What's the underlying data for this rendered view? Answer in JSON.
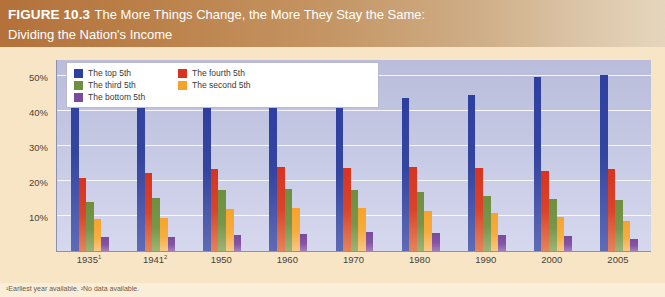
{
  "header": {
    "figure_label": "FIGURE 10.3",
    "title": "The More Things Change, the More They Stay the Same:",
    "subtitle": "Dividing the Nation's Income"
  },
  "footnote": "¹Earliest year available.  ²No data available.",
  "colors": {
    "top_5th": "#2e3fa2",
    "fourth_5th": "#d8331f",
    "third_5th": "#6d8f3f",
    "second_5th": "#f6a32b",
    "bottom_5th": "#7a4a9e",
    "plot_background": "#c3c6e2",
    "page_background": "#f8e5c6",
    "banner_start": "#b4713a",
    "banner_end": "#e6d6bd"
  },
  "chart_data": {
    "type": "bar",
    "title": "The More Things Change, the More They Stay the Same: Dividing the Nation's Income",
    "xlabel": "",
    "ylabel": "Percentage",
    "ylim": [
      0,
      55
    ],
    "yticks": [
      10,
      20,
      30,
      40,
      50
    ],
    "ytick_labels": [
      "10%",
      "20%",
      "30%",
      "40%",
      "50%"
    ],
    "grid": true,
    "legend_position": "top-left",
    "categories": [
      "1935¹",
      "1941²",
      "1950",
      "1960",
      "1970",
      "1980",
      "1990",
      "2000",
      "2005"
    ],
    "series": [
      {
        "name": "The top 5th",
        "color": "#2e3fa2",
        "values": [
          51.7,
          48.8,
          42.7,
          41.3,
          40.9,
          43.7,
          44.6,
          49.8,
          50.4
        ]
      },
      {
        "name": "The fourth 5th",
        "color": "#d8331f",
        "values": [
          20.9,
          22.3,
          23.5,
          24.0,
          23.8,
          24.2,
          23.8,
          23.0,
          23.4
        ]
      },
      {
        "name": "The third 5th",
        "color": "#6d8f3f",
        "values": [
          14.1,
          15.3,
          17.4,
          17.8,
          17.6,
          16.8,
          15.9,
          14.8,
          14.6
        ]
      },
      {
        "name": "The second 5th",
        "color": "#f6a32b",
        "values": [
          9.2,
          9.5,
          12.0,
          12.2,
          12.2,
          11.6,
          10.8,
          9.7,
          8.6
        ]
      },
      {
        "name": "The bottom 5th",
        "color": "#7a4a9e",
        "values": [
          4.1,
          4.1,
          4.5,
          4.8,
          5.4,
          5.2,
          4.6,
          4.3,
          3.4
        ]
      }
    ]
  },
  "legend": {
    "items": [
      {
        "label": "The top 5th"
      },
      {
        "label": "The fourth 5th"
      },
      {
        "label": "The third 5th"
      },
      {
        "label": "The second 5th"
      },
      {
        "label": "The bottom 5th"
      }
    ]
  }
}
